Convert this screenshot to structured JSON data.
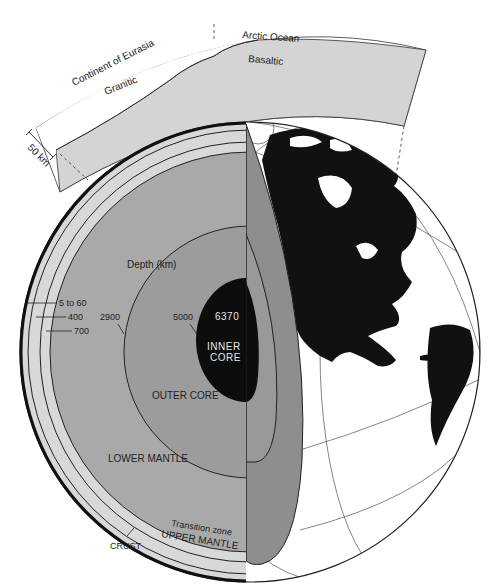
{
  "diagram": {
    "crust_inset": {
      "labels": {
        "continent": "Continent of Eurasia",
        "ocean": "Arctic Ocean",
        "granitic": "Granitic",
        "basaltic": "Basaltic",
        "scale": "50 km"
      }
    },
    "depth_label": "Depth (km)",
    "depths": {
      "crust": "5 to 60",
      "upper_mantle": "400",
      "transition": "700",
      "outer_core": "2900",
      "inner_core": "5000",
      "center": "6370"
    },
    "layers": {
      "inner_core_line1": "INNER",
      "inner_core_line2": "CORE",
      "outer_core": "OUTER CORE",
      "lower_mantle": "LOWER MANTLE",
      "transition_zone": "Transition zone",
      "upper_mantle": "UPPER MANTLE",
      "crust": "CRUST"
    },
    "colors": {
      "band_light": "#d8d8d8",
      "lower_mantle": "#a9a9a9",
      "outer_core": "#9c9c9c",
      "cut_face": "#8e8e8e",
      "inner_core": "#0d0d0d",
      "land": "#111111",
      "granitic": "#ffffff",
      "basaltic": "#d4d4d4"
    }
  }
}
